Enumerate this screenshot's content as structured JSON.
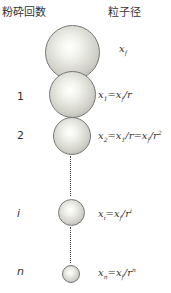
{
  "headers": {
    "left": "粉砕回数",
    "right": "粒子径"
  },
  "rows": [
    {
      "count": "",
      "formula": "x_f",
      "display": {
        "base": "x",
        "sub": "f",
        "rest": ""
      }
    },
    {
      "count": "1",
      "formula": "x_1 = x_f / r",
      "display": {
        "base": "x",
        "sub": "1",
        "rest": "=x",
        "sub2": "f",
        "tail": "/r",
        "sup": ""
      }
    },
    {
      "count": "2",
      "formula": "x_2 = x_1 / r = x_f / r^2",
      "display": {
        "base": "x",
        "sub": "2",
        "rest": "=x",
        "sub2": "1",
        "tail": "/r=x",
        "sub3": "f",
        "tail2": "/r",
        "sup": "2"
      }
    },
    {
      "count": "i",
      "formula": "x_i = x_f / r^i",
      "display": {
        "base": "x",
        "sub": "i",
        "rest": "=x",
        "sub2": "f",
        "tail": "/r",
        "sup": "i"
      }
    },
    {
      "count": "n",
      "formula": "x_n = x_f / r^n",
      "display": {
        "base": "x",
        "sub": "n",
        "rest": "=x",
        "sub2": "f",
        "tail": "/r",
        "sup": "n"
      }
    }
  ],
  "colors": {
    "sphere_highlight": "#ffffff",
    "sphere_shadow": "#9c9c96",
    "text": "#333333"
  }
}
